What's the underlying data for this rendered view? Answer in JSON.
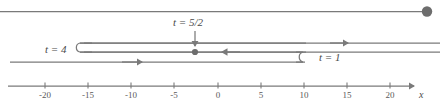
{
  "figure": {
    "type": "characteristics-diagram",
    "axis": {
      "name": "x-axis",
      "label": "x",
      "tick_labels": [
        "-20",
        "-15",
        "-10",
        "-5",
        "0",
        "5",
        "10",
        "15",
        "20"
      ],
      "tick_values": [
        -20,
        -15,
        -10,
        -5,
        0,
        5,
        10,
        15,
        20
      ],
      "range": [
        -23.5,
        23.5
      ],
      "arrow_direction": "right"
    },
    "annotations": [
      {
        "name": "label-t-equals-4",
        "text": "t = 4",
        "x": 45,
        "y": 45
      },
      {
        "name": "label-t-equals-5-2",
        "text": "t = 5/2",
        "x": 174,
        "y": 18
      },
      {
        "name": "label-t-equals-1",
        "text": "t = 1",
        "x": 319,
        "y": 53
      }
    ],
    "markers": [
      {
        "name": "endpoint-dot-top-right",
        "x": 427,
        "y": 11,
        "radius": 5
      },
      {
        "name": "point-dot-mid",
        "x": 195,
        "y": 52,
        "radius": 3
      }
    ],
    "colors": {
      "stroke": "#7a7a7a",
      "dot": "#6d6d6d",
      "text": "#4a4a4a",
      "background": "#ffffff"
    }
  }
}
